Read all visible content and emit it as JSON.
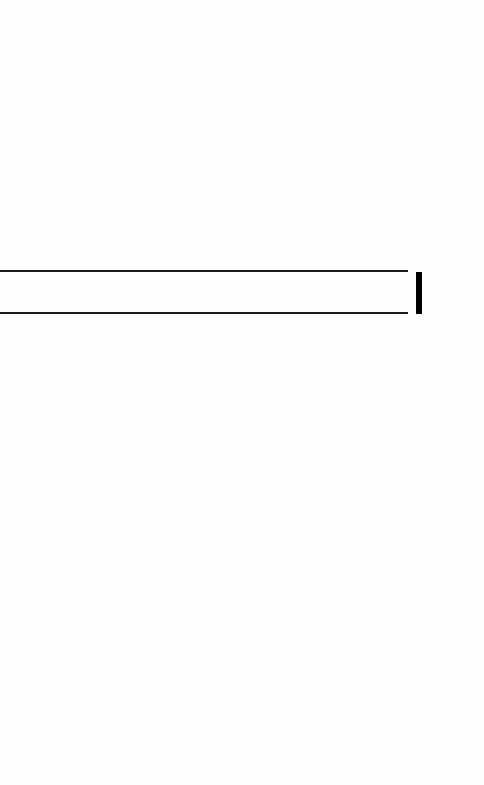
{
  "screen": {
    "background_color": "#fefefe"
  },
  "input": {
    "value": "",
    "placeholder": "",
    "border_color": "#1a1a1a"
  },
  "caret": {
    "icon": "text-cursor-icon",
    "color": "#000000"
  }
}
